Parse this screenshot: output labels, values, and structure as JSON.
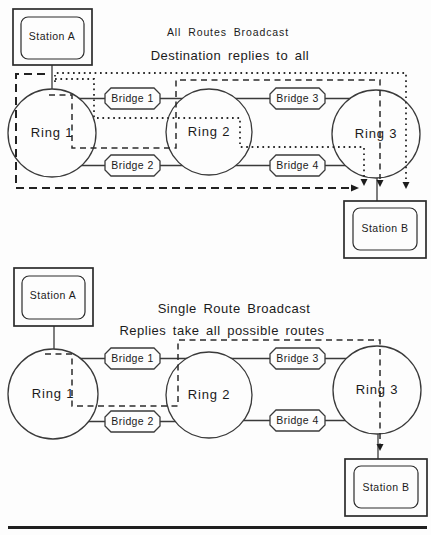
{
  "figure": {
    "top": {
      "title": "All Routes Broadcast",
      "subtitle": "Destination replies to all",
      "station_a": "Station A",
      "station_b": "Station B",
      "rings": [
        "Ring 1",
        "Ring 2",
        "Ring 3"
      ],
      "bridges": [
        "Bridge 1",
        "Bridge 2",
        "Bridge 3",
        "Bridge 4"
      ]
    },
    "bottom": {
      "title": "Single Route Broadcast",
      "subtitle": "Replies take all possible routes",
      "station_a": "Station A",
      "station_b": "Station B",
      "rings": [
        "Ring 1",
        "Ring 2",
        "Ring 3"
      ],
      "bridges": [
        "Bridge 1",
        "Bridge 2",
        "Bridge 3",
        "Bridge 4"
      ]
    },
    "colors": {
      "ink": "#2e2e2e",
      "paper": "#fdfdfd"
    }
  }
}
